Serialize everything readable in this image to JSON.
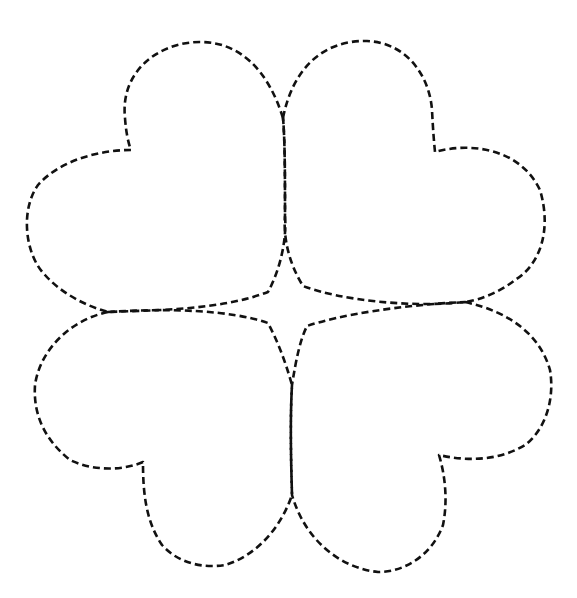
{
  "figure": {
    "stroke_color": "#111111",
    "background": "#ffffff",
    "leaves": [
      {
        "name": "top-left-leaf",
        "path": "M 283 118 C 268 70 240 42 200 42 C 160 42 120 70 125 118 C 126 132 128 142 131 150 C 100 150 60 160 38 185 C 20 210 25 255 45 275 C 60 292 85 306 108 312 C 160 310 220 310 268 292 C 280 270 287 240 285 215 C 285 180 285 140 283 118 Z"
      },
      {
        "name": "top-right-leaf",
        "path": "M 283 118 C 292 72 320 40 367 41 C 410 43 430 80 432 110 C 433 130 434 142 435 152 C 470 142 520 148 540 190 C 552 230 540 265 515 280 C 500 292 480 300 465 302 C 410 308 340 300 303 286 C 290 265 283 240 285 215 C 285 180 285 140 283 118 Z"
      },
      {
        "name": "bottom-left-leaf",
        "path": "M 108 312 C 70 320 40 350 35 385 C 33 415 45 440 70 460 C 95 472 125 470 143 462 C 143 490 145 520 162 545 C 180 565 205 568 225 565 C 255 556 280 530 292 495 C 291 460 290 420 292 385 C 285 360 277 340 268 323 C 230 310 170 308 108 312 Z"
      },
      {
        "name": "bottom-right-leaf",
        "path": "M 465 302 C 510 312 540 335 550 370 C 555 400 545 430 525 445 C 500 460 470 462 439 455 C 445 475 448 500 443 525 C 432 555 405 572 378 572 C 340 568 305 540 292 495 C 291 460 290 420 292 385 C 296 360 300 340 307 326 C 340 315 400 305 465 302 Z"
      }
    ]
  }
}
